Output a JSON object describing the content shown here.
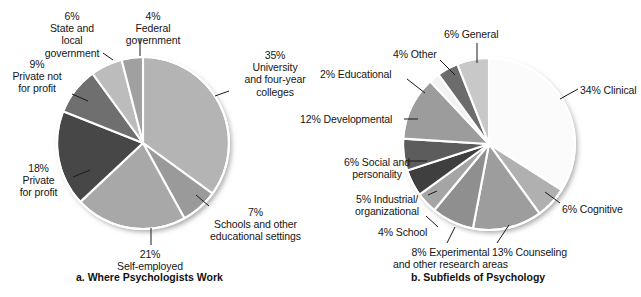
{
  "figure": {
    "background": "#ffffff",
    "outline_color": "#ffffff",
    "text_color": "#151515"
  },
  "panels": [
    {
      "id": "a",
      "caption": "a. Where Psychologists Work",
      "caption_x": 76,
      "caption_y": 271,
      "center": [
        143,
        143
      ],
      "radius": 86,
      "start_angle": -90
    },
    {
      "id": "b",
      "caption": "b. Subfields of Psychology",
      "caption_x": 411,
      "caption_y": 271,
      "center": [
        489,
        144
      ],
      "radius": 86,
      "start_angle": -90
    }
  ],
  "chart_data": [
    {
      "type": "pie",
      "title": "a. Where Psychologists Work",
      "xlabel": "",
      "ylabel": "",
      "legend": "none (direct labels with leader lines)",
      "total": 100,
      "units": "percent",
      "categories": [
        "University and four-year colleges",
        "Schools and other educational settings",
        "Self-employed",
        "Private for profit",
        "Private not for profit",
        "State and local government",
        "Federal government"
      ],
      "values": [
        35,
        7,
        21,
        18,
        9,
        6,
        4
      ],
      "colors": [
        "#b4b4b4",
        "#9a9a9a",
        "#a8a8a8",
        "#474747",
        "#6f6f6f",
        "#bcbcbc",
        "#a0a0a0"
      ],
      "slices": [
        {
          "percent_label": "35%",
          "name": "University\nand four-year\ncolleges",
          "value": 35,
          "color": "#b4b4b4",
          "label_lines": [
            "35%",
            "University",
            "and four-year",
            "colleges"
          ],
          "label_x": 230,
          "label_y": 49,
          "label_width": 90,
          "label_align": "center",
          "leader": [
            229,
            91,
            215,
            96
          ]
        },
        {
          "percent_label": "7%",
          "name": "Schools and other\neducational settings",
          "value": 7,
          "color": "#9a9a9a",
          "label_lines": [
            "7%",
            "Schools and other",
            "educational settings"
          ],
          "label_x": 193,
          "label_y": 206,
          "label_width": 125,
          "label_align": "center",
          "leader": [
            196,
            195,
            209,
            206
          ]
        },
        {
          "percent_label": "21%",
          "name": "Self-employed",
          "value": 21,
          "color": "#a8a8a8",
          "label_lines": [
            "21%",
            "Self-employed"
          ],
          "label_x": 105,
          "label_y": 248,
          "label_width": 90,
          "label_align": "center",
          "leader": [
            151,
            228,
            151,
            245
          ]
        },
        {
          "percent_label": "18%",
          "name": "Private\nfor profit",
          "value": 18,
          "color": "#474747",
          "label_lines": [
            "18%",
            "Private",
            "for profit"
          ],
          "label_x": 6,
          "label_y": 162,
          "label_width": 65,
          "label_align": "center",
          "leader": [
            73,
            177,
            90,
            170
          ]
        },
        {
          "percent_label": "9%",
          "name": "Private not\nfor profit",
          "value": 9,
          "color": "#6f6f6f",
          "label_lines": [
            "9%",
            "Private not",
            "for profit"
          ],
          "label_x": 4,
          "label_y": 58,
          "label_width": 66,
          "label_align": "center",
          "leader": [
            72,
            94,
            88,
            101
          ]
        },
        {
          "percent_label": "6%",
          "name": "State and\nlocal\ngovernment",
          "value": 6,
          "color": "#bcbcbc",
          "label_lines": [
            "6%",
            "State and",
            "local",
            "government"
          ],
          "label_x": 35,
          "label_y": 10,
          "label_width": 74,
          "label_align": "center",
          "leader": [
            113,
            60,
            103,
            53
          ]
        },
        {
          "percent_label": "4%",
          "name": "Federal\ngovernment",
          "value": 4,
          "color": "#a0a0a0",
          "label_lines": [
            "4%",
            "Federal",
            "government"
          ],
          "label_x": 116,
          "label_y": 10,
          "label_width": 74,
          "label_align": "center",
          "leader": [
            140,
            56,
            140,
            38
          ]
        }
      ]
    },
    {
      "type": "pie",
      "title": "b. Subfields of Psychology",
      "xlabel": "",
      "ylabel": "",
      "legend": "none (direct labels with leader lines)",
      "total": 100,
      "units": "percent",
      "categories": [
        "Clinical",
        "Cognitive",
        "Counseling",
        "Experimental and other research areas",
        "School",
        "Industrial/organizational",
        "Social and personality",
        "Developmental",
        "Educational",
        "Other",
        "General"
      ],
      "values": [
        34,
        6,
        13,
        8,
        4,
        5,
        6,
        12,
        2,
        4,
        6
      ],
      "colors": [
        "#fbfbfb",
        "#b0b0b0",
        "#9d9d9d",
        "#8f8f8f",
        "#a5a5a5",
        "#3f3f3f",
        "#5c5c5c",
        "#9c9c9c",
        "#f2f2f2",
        "#6c6c6c",
        "#c8c8c8"
      ],
      "slices": [
        {
          "percent_label": "34%",
          "name": "Clinical",
          "value": 34,
          "color": "#fbfbfb",
          "label_lines": [
            "34% Clinical"
          ],
          "label_x": 580,
          "label_y": 84,
          "label_width": 61,
          "label_align": "left",
          "leader": [
            560,
            99,
            578,
            89
          ]
        },
        {
          "percent_label": "6%",
          "name": "Cognitive",
          "value": 6,
          "color": "#b0b0b0",
          "label_lines": [
            "6% Cognitive"
          ],
          "label_x": 562,
          "label_y": 203,
          "label_width": 70,
          "label_align": "left",
          "leader": [
            545,
            192,
            560,
            203
          ]
        },
        {
          "percent_label": "13%",
          "name": "Counseling",
          "value": 13,
          "color": "#9d9d9d",
          "label_lines": [
            "13% Counseling"
          ],
          "label_x": 492,
          "label_y": 246,
          "label_width": 85,
          "label_align": "left",
          "leader": [
            509,
            225,
            497,
            243
          ]
        },
        {
          "percent_label": "8%",
          "name": "Experimental\nand other research areas",
          "value": 8,
          "color": "#8f8f8f",
          "label_lines": [
            "8% Experimental",
            "and other research areas"
          ],
          "label_x": 383,
          "label_y": 246,
          "label_width": 135,
          "label_align": "center",
          "leader": [
            455,
            227,
            447,
            243
          ]
        },
        {
          "percent_label": "4%",
          "name": "School",
          "value": 4,
          "color": "#a5a5a5",
          "label_lines": [
            "4% School"
          ],
          "label_x": 378,
          "label_y": 226,
          "label_width": 56,
          "label_align": "left",
          "leader": [
            426,
            216,
            438,
            227
          ]
        },
        {
          "percent_label": "5%",
          "name": "Industrial/\norganizational",
          "value": 5,
          "color": "#3f3f3f",
          "label_lines": [
            "5% Industrial/",
            "organizational"
          ],
          "label_x": 347,
          "label_y": 193,
          "label_width": 80,
          "label_align": "center",
          "leader": [
            428,
            195,
            437,
            191
          ]
        },
        {
          "percent_label": "6%",
          "name": "Social and\npersonality",
          "value": 6,
          "color": "#5c5c5c",
          "label_lines": [
            "6% Social and",
            "personality"
          ],
          "label_x": 337,
          "label_y": 156,
          "label_width": 80,
          "label_align": "center",
          "leader": [
            410,
            161,
            427,
            161
          ]
        },
        {
          "percent_label": "12%",
          "name": "Developmental",
          "value": 12,
          "color": "#9c9c9c",
          "label_lines": [
            "12% Developmental"
          ],
          "label_x": 300,
          "label_y": 113,
          "label_width": 102,
          "label_align": "left",
          "leader": [
            404,
            119,
            418,
            119
          ]
        },
        {
          "percent_label": "2%",
          "name": "Educational",
          "value": 2,
          "color": "#f2f2f2",
          "label_lines": [
            "2% Educational"
          ],
          "label_x": 320,
          "label_y": 68,
          "label_width": 85,
          "label_align": "left",
          "leader": [
            407,
            79,
            425,
            93
          ]
        },
        {
          "percent_label": "4%",
          "name": "Other",
          "value": 4,
          "color": "#6c6c6c",
          "label_lines": [
            "4% Other"
          ],
          "label_x": 393,
          "label_y": 48,
          "label_width": 54,
          "label_align": "left",
          "leader": [
            440,
            60,
            455,
            75
          ]
        },
        {
          "percent_label": "6%",
          "name": "General",
          "value": 6,
          "color": "#c8c8c8",
          "label_lines": [
            "6% General"
          ],
          "label_x": 444,
          "label_y": 28,
          "label_width": 64,
          "label_align": "left",
          "leader": [
            477,
            43,
            477,
            63
          ]
        }
      ]
    }
  ]
}
